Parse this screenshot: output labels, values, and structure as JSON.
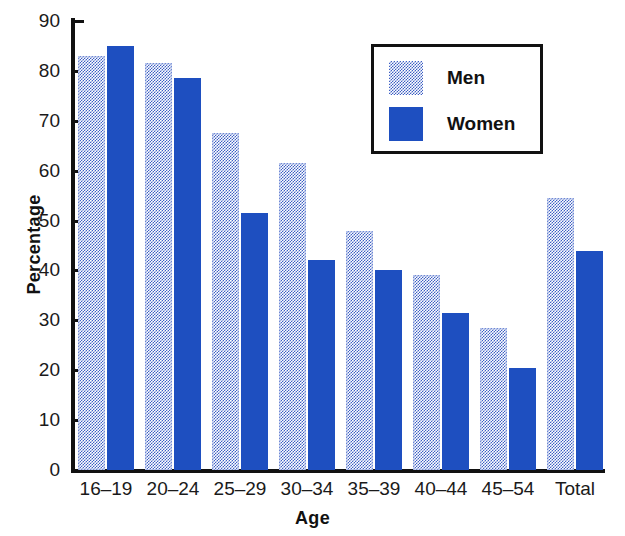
{
  "chart_data": {
    "type": "bar",
    "title": "",
    "xlabel": "Age",
    "ylabel": "Percentage",
    "categories": [
      "16–19",
      "20–24",
      "25–29",
      "30–34",
      "35–39",
      "40–44",
      "45–54",
      "Total"
    ],
    "series": [
      {
        "name": "Men",
        "color": "#3d5fc4",
        "pattern": "stipple-dotted",
        "values": [
          83,
          81.5,
          67.5,
          61.5,
          48,
          39,
          28.5,
          54.5
        ]
      },
      {
        "name": "Women",
        "color": "#1e4fc0",
        "pattern": "solid",
        "values": [
          85,
          78.5,
          51.5,
          42,
          40,
          31.5,
          20.5,
          44
        ]
      }
    ],
    "ylim": [
      0,
      90
    ],
    "yticks": [
      0,
      10,
      20,
      30,
      40,
      50,
      60,
      70,
      80,
      90
    ],
    "ytick_labels": [
      "0",
      "10",
      "20",
      "30",
      "40",
      "50",
      "60",
      "70",
      "80",
      "90"
    ],
    "grid": false,
    "legend_position": "upper-right-inside",
    "legend_entries": [
      "Men",
      "Women"
    ]
  },
  "axes": {
    "y_title": "Percentage",
    "x_title": "Age"
  },
  "legend": {
    "men_label": "Men",
    "women_label": "Women"
  }
}
